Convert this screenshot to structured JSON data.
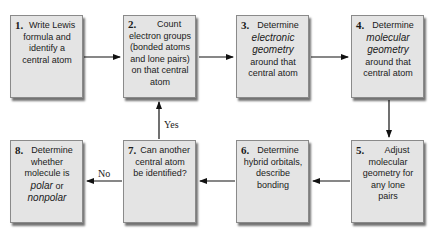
{
  "diagram": {
    "type": "flowchart",
    "steps": [
      {
        "num": "1.",
        "text": [
          "Write Lewis",
          "formula and",
          "identify a",
          "central atom"
        ]
      },
      {
        "num": "2.",
        "text": [
          "Count",
          "electron groups",
          "(bonded atoms",
          "and lone pairs)",
          "on that central",
          "atom"
        ]
      },
      {
        "num": "3.",
        "pre": "Determine",
        "emph": [
          "electronic",
          "geometry"
        ],
        "post": [
          "around that",
          "central atom"
        ]
      },
      {
        "num": "4.",
        "pre": "Determine",
        "emph": [
          "molecular",
          "geometry"
        ],
        "post": [
          "around that",
          "central atom"
        ]
      },
      {
        "num": "5.",
        "text": [
          "Adjust",
          "molecular",
          "geometry for",
          "any lone",
          "pairs"
        ]
      },
      {
        "num": "6.",
        "text": [
          "Determine",
          "hybrid orbitals,",
          "describe bonding"
        ]
      },
      {
        "num": "7.",
        "text": [
          "Can another",
          "central atom",
          "be identified?"
        ]
      },
      {
        "num": "8.",
        "text": [
          "Determine",
          "whether",
          "molecule is"
        ],
        "emph_lines": [
          "polar",
          "nonpolar"
        ],
        "connector": "or"
      }
    ],
    "edges": [
      {
        "from": "1",
        "to": "2"
      },
      {
        "from": "2",
        "to": "3"
      },
      {
        "from": "3",
        "to": "4"
      },
      {
        "from": "4",
        "to": "5"
      },
      {
        "from": "5",
        "to": "6"
      },
      {
        "from": "6",
        "to": "7"
      },
      {
        "from": "7",
        "to": "2",
        "label": "Yes"
      },
      {
        "from": "7",
        "to": "8",
        "label": "No"
      }
    ],
    "labels": {
      "yes": "Yes",
      "no": "No"
    },
    "colors": {
      "box_fill": "#e4e4e4",
      "box_border": "#8a8a8a",
      "arrow": "#111111"
    }
  }
}
